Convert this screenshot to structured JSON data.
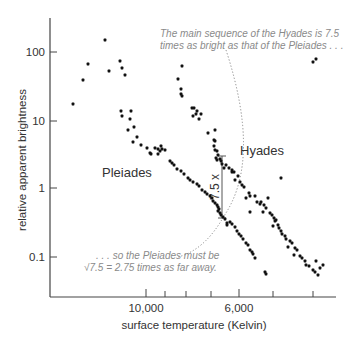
{
  "chart_data": {
    "type": "scatter",
    "title": "",
    "xlabel": "surface temperature (Kelvin)",
    "ylabel": "relative apparent brightness",
    "x_scale": "reversed (hot on left, cool on right)",
    "y_scale": "log",
    "ylim": [
      0.03,
      300
    ],
    "x_ticks": [
      {
        "label": "10,000",
        "px": 146
      },
      {
        "label": "",
        "px": 165
      },
      {
        "label": "",
        "px": 186
      },
      {
        "label": "",
        "px": 211
      },
      {
        "label": "6,000",
        "px": 239
      },
      {
        "label": "",
        "px": 273
      },
      {
        "label": "",
        "px": 313
      }
    ],
    "y_ticks": [
      {
        "label": "100",
        "value": 100,
        "py": 52
      },
      {
        "label": "10",
        "value": 10,
        "py": 121
      },
      {
        "label": "1",
        "value": 1,
        "py": 188
      },
      {
        "label": "0.1",
        "value": 0.1,
        "py": 257
      }
    ],
    "grid": false,
    "legend": null,
    "series": [
      {
        "name": "Pleiades",
        "label": "Pleiades",
        "points_px": [
          [
            73,
            104
          ],
          [
            83,
            80
          ],
          [
            88,
            64
          ],
          [
            105,
            40
          ],
          [
            109,
            71
          ],
          [
            120,
            61
          ],
          [
            122,
            68
          ],
          [
            125,
            75
          ],
          [
            121,
            111
          ],
          [
            122,
            116
          ],
          [
            131,
            111
          ],
          [
            130,
            119
          ],
          [
            128,
            130
          ],
          [
            134,
            127
          ],
          [
            133,
            142
          ],
          [
            137,
            137
          ],
          [
            141,
            145
          ],
          [
            147,
            148
          ],
          [
            150,
            153
          ],
          [
            151,
            154
          ],
          [
            155,
            148
          ],
          [
            158,
            149
          ],
          [
            160,
            151
          ],
          [
            161,
            146
          ],
          [
            162,
            149
          ],
          [
            158,
            154
          ],
          [
            165,
            150
          ],
          [
            170,
            161
          ],
          [
            172,
            163
          ],
          [
            174,
            165
          ],
          [
            177,
            169
          ],
          [
            181,
            171
          ],
          [
            184,
            174
          ],
          [
            188,
            178
          ],
          [
            190,
            180
          ],
          [
            193,
            182
          ],
          [
            197,
            184
          ],
          [
            199,
            186
          ],
          [
            202,
            190
          ],
          [
            205,
            192
          ],
          [
            207,
            194
          ],
          [
            210,
            196
          ],
          [
            212,
            198
          ],
          [
            213,
            201
          ],
          [
            215,
            203
          ],
          [
            217,
            205
          ],
          [
            218,
            207
          ],
          [
            219,
            209
          ],
          [
            218,
            211
          ],
          [
            220,
            213
          ],
          [
            221,
            215
          ],
          [
            223,
            217
          ],
          [
            225,
            219
          ],
          [
            227,
            223
          ],
          [
            227,
            225
          ],
          [
            230,
            222
          ],
          [
            232,
            224
          ],
          [
            235,
            227
          ],
          [
            237,
            231
          ],
          [
            239,
            234
          ],
          [
            241,
            236
          ],
          [
            243,
            239
          ],
          [
            246,
            243
          ],
          [
            248,
            245
          ],
          [
            250,
            250
          ],
          [
            252,
            252
          ],
          [
            253,
            254
          ],
          [
            255,
            258
          ],
          [
            265,
            272
          ],
          [
            266,
            274
          ]
        ]
      },
      {
        "name": "Hyades",
        "label": "Hyades",
        "points_px": [
          [
            182,
            66
          ],
          [
            178,
            79
          ],
          [
            181,
            89
          ],
          [
            181,
            94
          ],
          [
            182,
            96
          ],
          [
            192,
            108
          ],
          [
            194,
            108
          ],
          [
            197,
            111
          ],
          [
            196,
            114
          ],
          [
            193,
            116
          ],
          [
            201,
            114
          ],
          [
            199,
            119
          ],
          [
            215,
            130
          ],
          [
            208,
            133
          ],
          [
            214,
            140
          ],
          [
            215,
            141
          ],
          [
            214,
            146
          ],
          [
            215,
            150
          ],
          [
            217,
            151
          ],
          [
            218,
            155
          ],
          [
            216,
            158
          ],
          [
            220,
            159
          ],
          [
            217,
            160
          ],
          [
            221,
            161
          ],
          [
            222,
            164
          ],
          [
            226,
            165
          ],
          [
            224,
            168
          ],
          [
            229,
            168
          ],
          [
            232,
            170
          ],
          [
            232,
            172
          ],
          [
            234,
            172
          ],
          [
            238,
            176
          ],
          [
            235,
            180
          ],
          [
            240,
            182
          ],
          [
            242,
            185
          ],
          [
            244,
            187
          ],
          [
            249,
            193
          ],
          [
            250,
            196
          ],
          [
            246,
            198
          ],
          [
            255,
            196
          ],
          [
            257,
            202
          ],
          [
            260,
            204
          ],
          [
            261,
            202
          ],
          [
            264,
            205
          ],
          [
            266,
            208
          ],
          [
            263,
            212
          ],
          [
            270,
            213
          ],
          [
            272,
            215
          ],
          [
            274,
            218
          ],
          [
            276,
            220
          ],
          [
            275,
            221
          ],
          [
            278,
            225
          ],
          [
            273,
            226
          ],
          [
            279,
            228
          ],
          [
            281,
            231
          ],
          [
            282,
            234
          ],
          [
            285,
            236
          ],
          [
            286,
            239
          ],
          [
            290,
            241
          ],
          [
            292,
            243
          ],
          [
            288,
            247
          ],
          [
            295,
            248
          ],
          [
            297,
            250
          ],
          [
            294,
            255
          ],
          [
            300,
            256
          ],
          [
            302,
            258
          ],
          [
            305,
            261
          ],
          [
            306,
            265
          ],
          [
            309,
            266
          ],
          [
            313,
            270
          ],
          [
            315,
            272
          ],
          [
            318,
            275
          ],
          [
            316,
            261
          ],
          [
            320,
            268
          ],
          [
            323,
            265
          ],
          [
            250,
            212
          ],
          [
            268,
            198
          ],
          [
            281,
            178
          ],
          [
            313,
            62
          ],
          [
            316,
            59
          ]
        ]
      }
    ],
    "annotations": [
      {
        "text": "The main sequence of the Hyades is 7.5 times as bright as that of the Pleiades . . .",
        "px": [
          160,
          36
        ]
      },
      {
        "text": ". . . so the Pleiades must be √7.5 = 2.75 times as far away.",
        "px": [
          96,
          258
        ]
      },
      {
        "text": "7.5 x",
        "type": "vertical bracket between main sequences",
        "from_py": 156,
        "to_py": 218,
        "px": 222
      },
      {
        "text": "Hyades",
        "px": [
          240,
          155
        ]
      },
      {
        "text": "Pleiades",
        "px": [
          130,
          177
        ]
      }
    ]
  },
  "labels": {
    "y_axis_title": "relative apparent brightness",
    "x_axis_title": "surface temperature (Kelvin)",
    "y_tick_100": "100",
    "y_tick_10": "10",
    "y_tick_1": "1",
    "y_tick_01": "0.1",
    "x_tick_10000": "10,000",
    "x_tick_6000": "6,000",
    "pleiades": "Pleiades",
    "hyades": "Hyades",
    "ratio": "7.5 x",
    "annot_top_line1": "The main sequence of the Hyades is 7.5",
    "annot_top_line2": "times as bright as that of the Pleiades . . .",
    "annot_bottom_line1": ". . . so the Pleiades must be",
    "annot_bottom_line2": "√7.5 = 2.75 times as far away."
  },
  "colors": {
    "point": "#111111",
    "axis": "#444444",
    "text": "#333333",
    "annotation": "#8a8a8a",
    "arc": "#888888"
  }
}
